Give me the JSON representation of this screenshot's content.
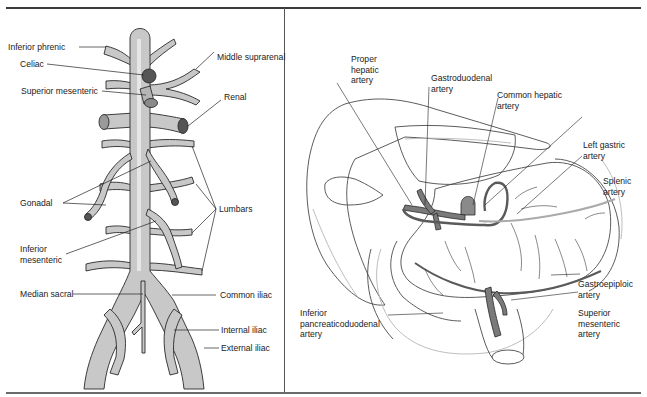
{
  "figure": {
    "left_panel": {
      "subject": "Abdominal aorta branches",
      "labels": {
        "inferior_phrenic": "Inferior phrenic",
        "celiac": "Celiac",
        "middle_suprarenal": "Middle suprarenal",
        "superior_mesenteric": "Superior mesenteric",
        "renal": "Renal",
        "gonadal": "Gonadal",
        "lumbars": "Lumbars",
        "inferior_mesenteric": "Inferior\nmesenteric",
        "median_sacral": "Median sacral",
        "common_iliac": "Common iliac",
        "internal_iliac": "Internal iliac",
        "external_iliac": "External iliac"
      }
    },
    "right_panel": {
      "subject": "Celiac trunk and mesenteric arteries",
      "labels": {
        "proper_hepatic": "Proper\nhepatic\nartery",
        "gastroduodenal": "Gastroduodenal\nartery",
        "common_hepatic": "Common hepatic\nartery",
        "left_gastric": "Left gastric\nartery",
        "splenic": "Splenic\nartery",
        "gastroepiploic": "Gastroepiploic\nartery",
        "superior_mesenteric": "Superior\nmesenteric\nartery",
        "inferior_pancreaticoduodenal": "Inferior\npancreaticoduodenal\nartery"
      }
    },
    "colors": {
      "vessel_fill": "#c8c8c8",
      "vessel_highlight": "#e6e6e6",
      "vessel_stroke": "#2a2a2a",
      "artery_dark": "#7a7a7a",
      "organ_stroke": "#4a4a4a",
      "organ_faint": "#b5b5b5",
      "rule": "#3a3a3a"
    }
  }
}
